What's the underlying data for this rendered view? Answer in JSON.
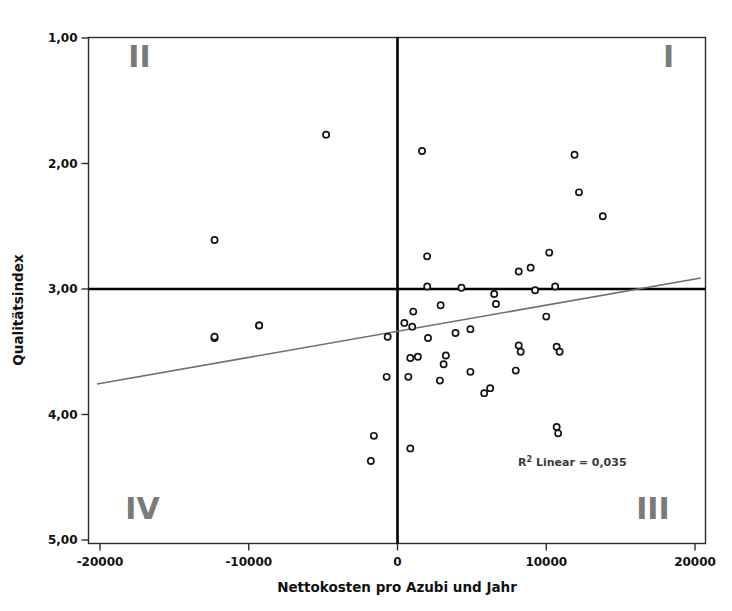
{
  "chart_data": {
    "type": "scatter",
    "title": "",
    "xlabel": "Nettokosten pro Azubi und Jahr",
    "ylabel": "Qualitätsindex",
    "xlim": [
      -21000,
      20600
    ],
    "ylim": [
      1.0,
      5.0
    ],
    "y_axis_inverted": true,
    "grid": false,
    "legend": null,
    "xticks": [
      -20000,
      -10000,
      0,
      10000,
      20000
    ],
    "xtick_labels": [
      "-20000",
      "-10000",
      "0",
      "10000",
      "20000"
    ],
    "yticks": [
      1.0,
      2.0,
      3.0,
      4.0,
      5.0
    ],
    "ytick_labels": [
      "1,00",
      "2,00",
      "3,00",
      "4,00",
      "5,00"
    ],
    "annotations": [
      {
        "name": "quadrant-II",
        "text": "II",
        "x": -18100,
        "y": 1.23
      },
      {
        "name": "quadrant-I",
        "text": "I",
        "x": 18600,
        "y": 1.23
      },
      {
        "name": "quadrant-IV",
        "text": "IV",
        "x": -18300,
        "y": 4.83
      },
      {
        "name": "quadrant-III",
        "text": "III",
        "x": 18300,
        "y": 4.83
      },
      {
        "name": "r2-annotation",
        "text": "R² Linear = 0,035",
        "x": 15400,
        "y": 4.41
      }
    ],
    "r_squared_text": "R² Linear = 0,035",
    "r_squared_value": 0.035,
    "reference_lines": [
      {
        "name": "vertical-reference-line",
        "orientation": "vertical",
        "value": 0
      },
      {
        "name": "horizontal-reference-line",
        "orientation": "horizontal",
        "value": 3.0
      }
    ],
    "fit_line": {
      "name": "linear-fit-line",
      "x": [
        -20200,
        20400
      ],
      "y": [
        3.757,
        2.912
      ]
    },
    "points": [
      {
        "x": -4800,
        "y": 1.77
      },
      {
        "x": -12300,
        "y": 2.61
      },
      {
        "x": -12300,
        "y": 3.39
      },
      {
        "x": -9300,
        "y": 3.29
      },
      {
        "x": 1650,
        "y": 1.9
      },
      {
        "x": 11900,
        "y": 1.93
      },
      {
        "x": 12200,
        "y": 2.23
      },
      {
        "x": 13800,
        "y": 2.42
      },
      {
        "x": 10200,
        "y": 2.71
      },
      {
        "x": 8150,
        "y": 2.86
      },
      {
        "x": 8950,
        "y": 2.83
      },
      {
        "x": 4300,
        "y": 2.99
      },
      {
        "x": 1990,
        "y": 2.74
      },
      {
        "x": 9250,
        "y": 3.01
      },
      {
        "x": 2000,
        "y": 2.98
      },
      {
        "x": 2900,
        "y": 3.13
      },
      {
        "x": 1060,
        "y": 3.18
      },
      {
        "x": 460,
        "y": 3.27
      },
      {
        "x": 990,
        "y": 3.3
      },
      {
        "x": -660,
        "y": 3.38
      },
      {
        "x": 2050,
        "y": 3.39
      },
      {
        "x": 3900,
        "y": 3.35
      },
      {
        "x": 4900,
        "y": 3.32
      },
      {
        "x": 6500,
        "y": 3.04
      },
      {
        "x": 6620,
        "y": 3.12
      },
      {
        "x": 10000,
        "y": 3.22
      },
      {
        "x": 10600,
        "y": 2.98
      },
      {
        "x": 10700,
        "y": 3.46
      },
      {
        "x": 10900,
        "y": 3.5
      },
      {
        "x": -12300,
        "y": 3.38
      },
      {
        "x": -9300,
        "y": 3.29
      },
      {
        "x": 860,
        "y": 3.55
      },
      {
        "x": 3250,
        "y": 3.53
      },
      {
        "x": 3100,
        "y": 3.6
      },
      {
        "x": -730,
        "y": 3.7
      },
      {
        "x": 730,
        "y": 3.7
      },
      {
        "x": 2850,
        "y": 3.73
      },
      {
        "x": 4900,
        "y": 3.66
      },
      {
        "x": 5830,
        "y": 3.83
      },
      {
        "x": 6230,
        "y": 3.79
      },
      {
        "x": 8150,
        "y": 3.45
      },
      {
        "x": 8280,
        "y": 3.5
      },
      {
        "x": 7950,
        "y": 3.65
      },
      {
        "x": 10700,
        "y": 4.1
      },
      {
        "x": 10800,
        "y": 4.15
      },
      {
        "x": -1590,
        "y": 4.17
      },
      {
        "x": 860,
        "y": 4.27
      },
      {
        "x": -1790,
        "y": 4.37
      },
      {
        "x": 1370,
        "y": 3.54
      }
    ]
  }
}
